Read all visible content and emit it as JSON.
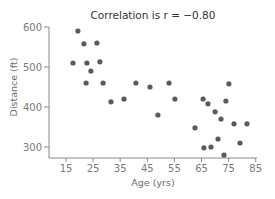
{
  "chart_data": {
    "type": "scatter",
    "title": "Correlation is r = −0.80",
    "xlabel": "Age (yrs)",
    "ylabel": "Distance (ft)",
    "xlim": [
      5,
      85
    ],
    "ylim": [
      270,
      610
    ],
    "xticks": [
      15,
      25,
      35,
      45,
      55,
      65,
      75,
      85
    ],
    "yticks": [
      300,
      400,
      500,
      600
    ],
    "grid": false,
    "legend": null,
    "marker_color": "#5a5a5a",
    "axis_color": "#8a8a8a",
    "points": [
      {
        "x": 19.4,
        "y": 590
      },
      {
        "x": 21.6,
        "y": 558
      },
      {
        "x": 26.4,
        "y": 560
      },
      {
        "x": 17.6,
        "y": 510
      },
      {
        "x": 22.7,
        "y": 510
      },
      {
        "x": 27.5,
        "y": 513
      },
      {
        "x": 24.2,
        "y": 490
      },
      {
        "x": 22.4,
        "y": 460
      },
      {
        "x": 28.7,
        "y": 460
      },
      {
        "x": 31.6,
        "y": 413
      },
      {
        "x": 36.4,
        "y": 420
      },
      {
        "x": 40.8,
        "y": 460
      },
      {
        "x": 46.0,
        "y": 450
      },
      {
        "x": 53.0,
        "y": 460
      },
      {
        "x": 55.2,
        "y": 420
      },
      {
        "x": 48.9,
        "y": 380
      },
      {
        "x": 75.1,
        "y": 458
      },
      {
        "x": 65.6,
        "y": 420
      },
      {
        "x": 67.4,
        "y": 408
      },
      {
        "x": 74.0,
        "y": 415
      },
      {
        "x": 70.0,
        "y": 388
      },
      {
        "x": 72.2,
        "y": 370
      },
      {
        "x": 77.0,
        "y": 358
      },
      {
        "x": 81.8,
        "y": 358
      },
      {
        "x": 62.6,
        "y": 348
      },
      {
        "x": 71.1,
        "y": 320
      },
      {
        "x": 79.2,
        "y": 310
      },
      {
        "x": 65.9,
        "y": 298
      },
      {
        "x": 68.5,
        "y": 300
      },
      {
        "x": 73.3,
        "y": 280
      }
    ]
  }
}
